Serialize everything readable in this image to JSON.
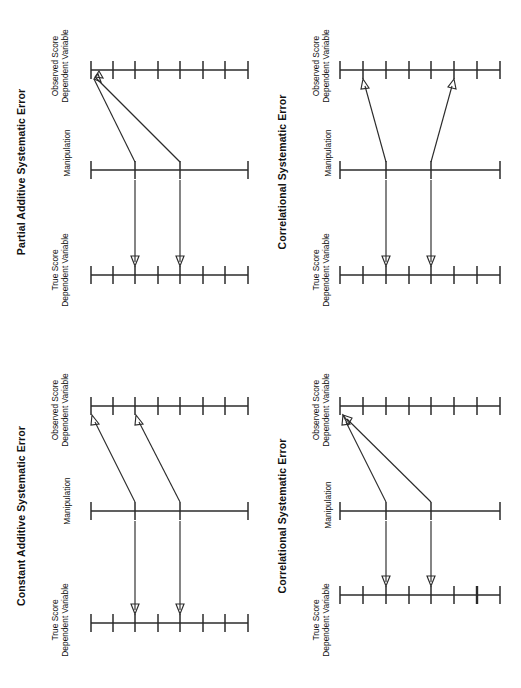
{
  "figure": {
    "background": "#ffffff",
    "ink_color": "#2b2b2b",
    "orientation": "rotated-90-counterclockwise",
    "panel_count": 4
  },
  "labels": {
    "observed_line1": "Observed Score",
    "observed_line2": "Dependent Variable",
    "manipulation": "Manipulation",
    "true_line1": "True Score",
    "true_line2": "Dependent Variable"
  },
  "panels": [
    {
      "id": "partial-additive-systematic-error",
      "position": "top-left",
      "title": "Partial Additive Systematic Error",
      "axes": [
        {
          "name": "observed-score-axis",
          "role": "observed",
          "ticks": 8
        },
        {
          "name": "manipulation-axis",
          "role": "manipulation",
          "ticks": 4
        },
        {
          "name": "true-score-axis",
          "role": "true",
          "ticks": 8
        }
      ],
      "mapping_arrows": [
        {
          "from_tick": 2,
          "to_tick": 1,
          "from_axis": "manipulation",
          "to_axis": "observed"
        },
        {
          "from_tick": 5,
          "to_tick": 1,
          "from_axis": "manipulation",
          "to_axis": "observed"
        }
      ],
      "true_arrows": [
        {
          "from_tick": 2,
          "to_tick": 2
        },
        {
          "from_tick": 5,
          "to_tick": 5
        }
      ]
    },
    {
      "id": "correlational-systematic-error-top",
      "position": "top-right",
      "title": "Correlational Systematic Error",
      "axes": [
        {
          "name": "observed-score-axis",
          "role": "observed",
          "ticks": 8
        },
        {
          "name": "manipulation-axis",
          "role": "manipulation",
          "ticks": 4
        },
        {
          "name": "true-score-axis",
          "role": "true",
          "ticks": 8
        }
      ],
      "mapping_arrows": [
        {
          "from_tick": 2,
          "to_tick": 1,
          "from_axis": "manipulation",
          "to_axis": "observed"
        },
        {
          "from_tick": 5,
          "to_tick": 6,
          "from_axis": "manipulation",
          "to_axis": "observed"
        }
      ],
      "true_arrows": [
        {
          "from_tick": 2,
          "to_tick": 2
        },
        {
          "from_tick": 5,
          "to_tick": 5
        }
      ]
    },
    {
      "id": "constant-additive-systematic-error",
      "position": "bottom-left",
      "title": "Constant Additive Systematic Error",
      "axes": [
        {
          "name": "observed-score-axis",
          "role": "observed",
          "ticks": 8
        },
        {
          "name": "manipulation-axis",
          "role": "manipulation",
          "ticks": 4
        },
        {
          "name": "true-score-axis",
          "role": "true",
          "ticks": 8
        }
      ],
      "mapping_arrows": [
        {
          "from_tick": 2,
          "to_tick": 0,
          "from_axis": "manipulation",
          "to_axis": "observed"
        },
        {
          "from_tick": 5,
          "to_tick": 2,
          "from_axis": "manipulation",
          "to_axis": "observed"
        }
      ],
      "true_arrows": [
        {
          "from_tick": 2,
          "to_tick": 2
        },
        {
          "from_tick": 5,
          "to_tick": 5
        }
      ]
    },
    {
      "id": "correlational-systematic-error-bottom",
      "position": "bottom-right",
      "title": "Correlational Systematic Error",
      "axes": [
        {
          "name": "observed-score-axis",
          "role": "observed",
          "ticks": 8
        },
        {
          "name": "manipulation-axis",
          "role": "manipulation",
          "ticks": 4
        },
        {
          "name": "true-score-axis",
          "role": "true",
          "ticks": 8,
          "bold_tick_index": 6
        }
      ],
      "mapping_arrows": [
        {
          "from_tick": 2,
          "to_tick": 1,
          "from_axis": "manipulation",
          "to_axis": "observed"
        },
        {
          "from_tick": 5,
          "to_tick": 1,
          "from_axis": "manipulation",
          "to_axis": "observed"
        }
      ],
      "true_arrows": [
        {
          "from_tick": 2,
          "to_tick": 2
        },
        {
          "from_tick": 5,
          "to_tick": 5
        }
      ]
    }
  ]
}
